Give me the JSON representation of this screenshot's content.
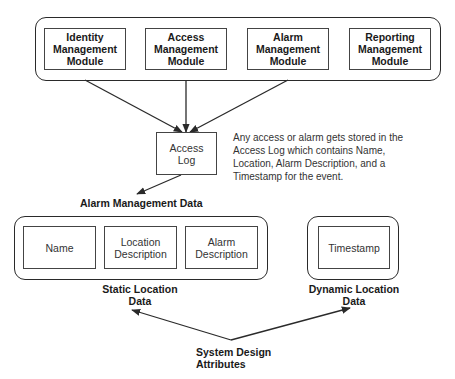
{
  "diagram": {
    "top_group": {
      "modules": [
        {
          "lines": [
            "Identity",
            "Management",
            "Module"
          ]
        },
        {
          "lines": [
            "Access",
            "Management",
            "Module"
          ]
        },
        {
          "lines": [
            "Alarm",
            "Management",
            "Module"
          ]
        },
        {
          "lines": [
            "Reporting",
            "Management",
            "Module"
          ]
        }
      ]
    },
    "access_log": {
      "lines": [
        "Access",
        "Log"
      ]
    },
    "annotation": {
      "lines": [
        "Any access or alarm gets stored in the",
        "Access Log which contains Name,",
        "Location, Alarm Description, and a",
        "Timestamp for the event."
      ]
    },
    "alarm_data_title": "Alarm Management Data",
    "static_group": {
      "items": [
        {
          "lines": [
            "Name"
          ]
        },
        {
          "lines": [
            "Location",
            "Description"
          ]
        },
        {
          "lines": [
            "Alarm",
            "Description"
          ]
        }
      ],
      "caption": [
        "Static Location",
        "Data"
      ]
    },
    "dynamic_group": {
      "items": [
        {
          "lines": [
            "Timestamp"
          ]
        }
      ],
      "caption": [
        "Dynamic Location",
        "Data"
      ]
    },
    "system_design": {
      "lines": [
        "System Design",
        "Attributes"
      ]
    },
    "colors": {
      "line": "#2a2a2a",
      "background": "#ffffff"
    }
  }
}
